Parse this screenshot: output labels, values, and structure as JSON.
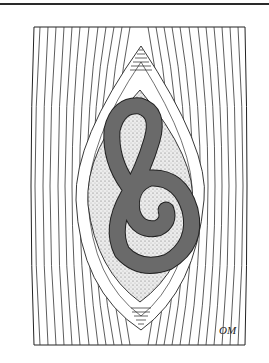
{
  "illustration": {
    "subject": "encysted larva coiled inside cyst within muscle fibers",
    "signature": "OM",
    "colors": {
      "background": "#ffffff",
      "line": "#1e1e1e",
      "larva_fill": "#6a6a6a",
      "cyst_fill": "#e6e6e6",
      "top_rule": "#2a2a2a"
    },
    "frame": {
      "left": 33,
      "top": 27,
      "right": 245,
      "bottom": 345
    }
  }
}
